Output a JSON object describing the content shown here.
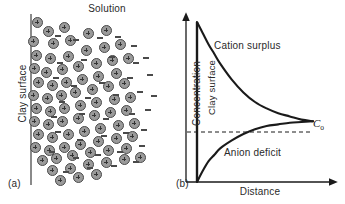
{
  "figure": {
    "panel_a": {
      "tag": "(a)",
      "solution_label": "Solution",
      "surface_label": "Clay surface",
      "cation_icon": "cation-plus-circle-icon",
      "anion_icon": "anion-minus-dash-icon",
      "cations": [
        [
          37,
          22
        ],
        [
          48,
          31
        ],
        [
          64,
          27
        ],
        [
          33,
          41
        ],
        [
          53,
          43
        ],
        [
          70,
          40
        ],
        [
          88,
          33
        ],
        [
          106,
          30
        ],
        [
          36,
          55
        ],
        [
          50,
          58
        ],
        [
          68,
          56
        ],
        [
          86,
          50
        ],
        [
          104,
          47
        ],
        [
          120,
          44
        ],
        [
          34,
          68
        ],
        [
          46,
          72
        ],
        [
          62,
          69
        ],
        [
          78,
          66
        ],
        [
          96,
          63
        ],
        [
          112,
          60
        ],
        [
          128,
          58
        ],
        [
          38,
          82
        ],
        [
          52,
          85
        ],
        [
          66,
          82
        ],
        [
          82,
          79
        ],
        [
          98,
          76
        ],
        [
          116,
          73
        ],
        [
          33,
          95
        ],
        [
          47,
          98
        ],
        [
          61,
          95
        ],
        [
          75,
          92
        ],
        [
          92,
          89
        ],
        [
          108,
          86
        ],
        [
          124,
          83
        ],
        [
          36,
          108
        ],
        [
          50,
          111
        ],
        [
          64,
          108
        ],
        [
          80,
          105
        ],
        [
          96,
          102
        ],
        [
          114,
          99
        ],
        [
          130,
          97
        ],
        [
          34,
          121
        ],
        [
          48,
          124
        ],
        [
          62,
          121
        ],
        [
          78,
          118
        ],
        [
          94,
          115
        ],
        [
          110,
          112
        ],
        [
          126,
          110
        ],
        [
          38,
          134
        ],
        [
          52,
          137
        ],
        [
          68,
          134
        ],
        [
          84,
          131
        ],
        [
          100,
          128
        ],
        [
          118,
          125
        ],
        [
          134,
          123
        ],
        [
          35,
          147
        ],
        [
          49,
          150
        ],
        [
          64,
          147
        ],
        [
          80,
          144
        ],
        [
          98,
          141
        ],
        [
          116,
          138
        ],
        [
          132,
          136
        ],
        [
          42,
          160
        ],
        [
          56,
          158
        ],
        [
          72,
          155
        ],
        [
          90,
          152
        ],
        [
          108,
          150
        ],
        [
          126,
          148
        ],
        [
          52,
          170
        ],
        [
          70,
          168
        ],
        [
          88,
          164
        ],
        [
          106,
          162
        ],
        [
          124,
          159
        ],
        [
          140,
          157
        ],
        [
          60,
          180
        ],
        [
          78,
          177
        ],
        [
          96,
          174
        ]
      ],
      "anions": [
        [
          58,
          36
        ],
        [
          76,
          40
        ],
        [
          100,
          38
        ],
        [
          118,
          37
        ],
        [
          134,
          46
        ],
        [
          60,
          63
        ],
        [
          84,
          60
        ],
        [
          112,
          57
        ],
        [
          136,
          63
        ],
        [
          146,
          58
        ],
        [
          56,
          78
        ],
        [
          74,
          86
        ],
        [
          102,
          83
        ],
        [
          130,
          78
        ],
        [
          150,
          75
        ],
        [
          62,
          102
        ],
        [
          88,
          98
        ],
        [
          116,
          95
        ],
        [
          140,
          92
        ],
        [
          154,
          96
        ],
        [
          54,
          117
        ],
        [
          82,
          114
        ],
        [
          106,
          119
        ],
        [
          132,
          114
        ],
        [
          148,
          110
        ],
        [
          58,
          132
        ],
        [
          80,
          140
        ],
        [
          104,
          136
        ],
        [
          126,
          133
        ],
        [
          144,
          130
        ],
        [
          52,
          152
        ],
        [
          76,
          158
        ],
        [
          98,
          155
        ],
        [
          120,
          152
        ],
        [
          142,
          146
        ],
        [
          66,
          172
        ],
        [
          90,
          168
        ],
        [
          114,
          166
        ],
        [
          136,
          162
        ]
      ]
    },
    "panel_b": {
      "tag": "(b)",
      "ylabel": "Concentration",
      "xlabel": "Distance",
      "surface_label": "Clay surface",
      "cation_annotation": "Cation surplus",
      "anion_annotation": "Anion deficit",
      "c0_label": "C",
      "c0_subscript": "o"
    }
  },
  "chart_data": {
    "type": "line",
    "title": "",
    "xlabel": "Distance",
    "ylabel": "Concentration",
    "xlim": [
      0,
      1
    ],
    "ylim": [
      0,
      1
    ],
    "grid": false,
    "legend": "inline-annotations",
    "reference_line": {
      "label": "Co",
      "value": 0.38,
      "style": "dashed",
      "orientation": "horizontal"
    },
    "annotations": [
      "Cation surplus",
      "Anion deficit",
      "Clay surface"
    ],
    "series": [
      {
        "name": "Cation surplus",
        "x": [
          0.0,
          0.05,
          0.1,
          0.15,
          0.2,
          0.3,
          0.4,
          0.5,
          0.6,
          0.7,
          0.8,
          0.9,
          1.0
        ],
        "y": [
          1.0,
          0.93,
          0.86,
          0.8,
          0.74,
          0.64,
          0.56,
          0.5,
          0.46,
          0.43,
          0.41,
          0.39,
          0.38
        ]
      },
      {
        "name": "Anion deficit",
        "x": [
          0.0,
          0.05,
          0.1,
          0.15,
          0.2,
          0.3,
          0.4,
          0.5,
          0.6,
          0.7,
          0.8,
          0.9,
          1.0
        ],
        "y": [
          0.0,
          0.07,
          0.13,
          0.17,
          0.21,
          0.26,
          0.3,
          0.33,
          0.35,
          0.36,
          0.37,
          0.375,
          0.38
        ]
      }
    ]
  },
  "colors": {
    "ion_fill": "#9a9a9a",
    "ion_stroke": "#4a4a4a",
    "axis": "#1a1a1a",
    "clay_line": "#8a8a8a",
    "text": "#2a2a2a"
  }
}
